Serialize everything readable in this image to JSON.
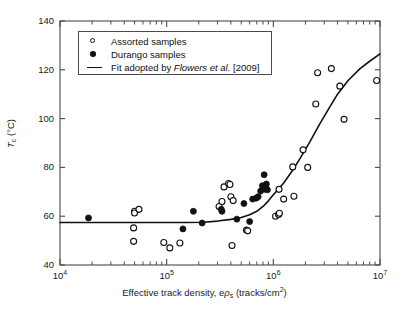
{
  "chart_data": {
    "type": "scatter",
    "title": "",
    "xlabel": "Effective track density, eρs (tracks/cm2)",
    "xlabel_parts": {
      "pre": "Effective track density, e",
      "rho": "ρ",
      "sub": "s",
      "mid": " (tracks/cm",
      "sup": "2",
      "post": ")"
    },
    "ylabel": "Tc (°C)",
    "ylabel_parts": {
      "T": "T",
      "sub": "c",
      "unit": " (°C)"
    },
    "xscale": "log",
    "xlim": [
      10000,
      10000000
    ],
    "ylim": [
      40,
      140
    ],
    "yticks": [
      40,
      60,
      80,
      100,
      120,
      140
    ],
    "xticks": [
      10000,
      100000,
      1000000,
      10000000
    ],
    "xtick_labels": [
      "10⁴",
      "10⁵",
      "10⁶",
      "10⁷"
    ],
    "grid": false,
    "legend_position": "upper-left-inside",
    "series": [
      {
        "name": "Assorted samples",
        "marker": "open-circle",
        "color": "#111111",
        "points": [
          [
            50000,
            62.0
          ],
          [
            50000,
            61.3
          ],
          [
            55000,
            62.8
          ],
          [
            49000,
            55.2
          ],
          [
            49000,
            49.7
          ],
          [
            94000,
            49.2
          ],
          [
            107000,
            47.0
          ],
          [
            133000,
            49.0
          ],
          [
            310000,
            64.0
          ],
          [
            330000,
            66.0
          ],
          [
            345000,
            72.0
          ],
          [
            380000,
            73.4
          ],
          [
            392000,
            73.0
          ],
          [
            400000,
            68.0
          ],
          [
            410000,
            48.0
          ],
          [
            420000,
            66.4
          ],
          [
            560000,
            54.3
          ],
          [
            575000,
            54.0
          ],
          [
            1050000,
            60.0
          ],
          [
            1120000,
            60.7
          ],
          [
            1140000,
            61.2
          ],
          [
            1130000,
            71.0
          ],
          [
            1250000,
            67.0
          ],
          [
            1520000,
            80.2
          ],
          [
            1560000,
            68.2
          ],
          [
            1900000,
            87.2
          ],
          [
            2100000,
            80.0
          ],
          [
            2500000,
            106.0
          ],
          [
            2600000,
            118.8
          ],
          [
            3500000,
            120.5
          ],
          [
            4200000,
            113.3
          ],
          [
            4600000,
            99.7
          ],
          [
            9300000,
            115.6
          ]
        ]
      },
      {
        "name": "Durango samples",
        "marker": "filled-circle",
        "color": "#111111",
        "points": [
          [
            18500,
            59.3
          ],
          [
            142000,
            54.8
          ],
          [
            178000,
            62.0
          ],
          [
            215000,
            57.2
          ],
          [
            325000,
            62.8
          ],
          [
            330000,
            62.0
          ],
          [
            455000,
            58.8
          ],
          [
            530000,
            65.2
          ],
          [
            600000,
            57.8
          ],
          [
            640000,
            67.0
          ],
          [
            690000,
            67.4
          ],
          [
            720000,
            68.0
          ],
          [
            760000,
            70.3
          ],
          [
            790000,
            72.5
          ],
          [
            820000,
            77.0
          ],
          [
            840000,
            71.0
          ],
          [
            850000,
            72.0
          ],
          [
            860000,
            73.2
          ],
          [
            880000,
            70.8
          ]
        ]
      }
    ],
    "fit": {
      "name": "Fit adopted by Flowers et al. [2009]",
      "style": "solid-line",
      "color": "#111111",
      "points": [
        [
          10000,
          57.4
        ],
        [
          20000,
          57.4
        ],
        [
          40000,
          57.4
        ],
        [
          80000,
          57.4
        ],
        [
          150000,
          57.4
        ],
        [
          220000,
          57.5
        ],
        [
          300000,
          58.0
        ],
        [
          400000,
          58.7
        ],
        [
          500000,
          59.5
        ],
        [
          600000,
          60.6
        ],
        [
          700000,
          62.0
        ],
        [
          800000,
          64.0
        ],
        [
          900000,
          66.3
        ],
        [
          1000000,
          68.8
        ],
        [
          1100000,
          70.8
        ],
        [
          1250000,
          73.6
        ],
        [
          1500000,
          78.5
        ],
        [
          1800000,
          84.0
        ],
        [
          2200000,
          90.5
        ],
        [
          2700000,
          97.5
        ],
        [
          3300000,
          104.0
        ],
        [
          4000000,
          110.0
        ],
        [
          5000000,
          115.5
        ],
        [
          6500000,
          120.5
        ],
        [
          8000000,
          123.5
        ],
        [
          10000000,
          126.5
        ]
      ]
    }
  },
  "legend": {
    "items": [
      {
        "label": "Assorted samples",
        "key": "open-circle"
      },
      {
        "label": "Durango samples",
        "key": "filled-circle"
      },
      {
        "label_pre": "Fit adopted by ",
        "label_italic": "Flowers et al.",
        "label_post": " [2009]",
        "key": "line"
      }
    ]
  }
}
